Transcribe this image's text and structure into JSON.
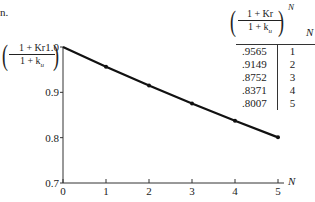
{
  "page": {
    "fragment": "n."
  },
  "y_label": {
    "numerator": "1 + Kr",
    "denominator": "1 + k_u"
  },
  "table": {
    "header_expr": {
      "numerator": "1 + Kr",
      "denominator": "1 + k_u",
      "exponent": "N"
    },
    "header_n": "N",
    "rows": [
      {
        "value": ".9565",
        "n": "1"
      },
      {
        "value": ".9149",
        "n": "2"
      },
      {
        "value": ".8752",
        "n": "3"
      },
      {
        "value": ".8371",
        "n": "4"
      },
      {
        "value": ".8007",
        "n": "5"
      }
    ]
  },
  "chart_data": {
    "type": "line",
    "title": "",
    "xlabel": "N",
    "ylabel": "((1 + Kr)/(1 + k_u))",
    "x": [
      0,
      1,
      2,
      3,
      4,
      5
    ],
    "values": [
      1.0,
      0.9565,
      0.9149,
      0.8752,
      0.8371,
      0.8007
    ],
    "xlim": [
      0,
      5
    ],
    "ylim": [
      0.7,
      1.0
    ],
    "x_ticks": [
      "0",
      "1",
      "2",
      "3",
      "4",
      "5"
    ],
    "y_ticks": [
      "0.7",
      "0.8",
      "0.9",
      "1.0"
    ],
    "grid": false,
    "color": "#111111"
  }
}
